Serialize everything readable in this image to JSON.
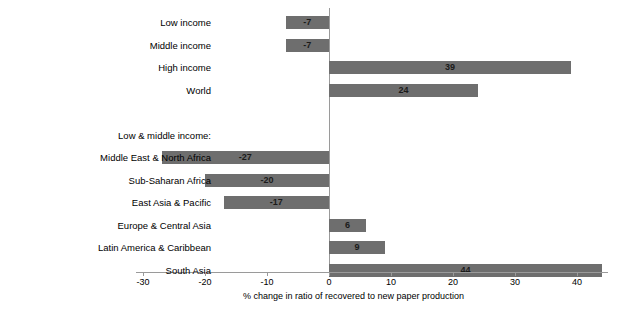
{
  "chart_data": {
    "type": "bar",
    "orientation": "horizontal",
    "title": "",
    "xlabel": "% change in ratio of recovered to new paper production",
    "ylabel": "",
    "xlim": [
      -30,
      45
    ],
    "xticks": [
      -30,
      -20,
      -10,
      0,
      10,
      20,
      30,
      40
    ],
    "xticklabels": [
      "-30",
      "-20",
      "-10",
      "0",
      "10",
      "20",
      "30",
      "40"
    ],
    "grid": false,
    "legend": false,
    "bar_color": "#6e6e6e",
    "categories": [
      "Low income",
      "Middle income",
      "High income",
      "World",
      "Middle East & North Africa",
      "Sub-Saharan Africa",
      "East Asia & Pacific",
      "Europe & Central Asia",
      "Latin America & Caribbean",
      "South Asia"
    ],
    "values": [
      -7,
      -7,
      39,
      24,
      -27,
      -20,
      -17,
      6,
      9,
      44
    ],
    "group_header": "Low & middle income:",
    "group_header_after_index": 3
  },
  "rows": [
    {
      "label": "Low income",
      "value": -7,
      "value_text": "-7",
      "type": "bar"
    },
    {
      "label": "Middle income",
      "value": -7,
      "value_text": "-7",
      "type": "bar"
    },
    {
      "label": "High income",
      "value": 39,
      "value_text": "39",
      "type": "bar"
    },
    {
      "label": "World",
      "value": 24,
      "value_text": "24",
      "type": "bar"
    },
    {
      "label": "",
      "value": null,
      "value_text": "",
      "type": "spacer"
    },
    {
      "label": "Low & middle income:",
      "value": null,
      "value_text": "",
      "type": "header"
    },
    {
      "label": "Middle East & North Africa",
      "value": -27,
      "value_text": "-27",
      "type": "bar"
    },
    {
      "label": "Sub-Saharan Africa",
      "value": -20,
      "value_text": "-20",
      "type": "bar"
    },
    {
      "label": "East Asia & Pacific",
      "value": -17,
      "value_text": "-17",
      "type": "bar"
    },
    {
      "label": "Europe & Central Asia",
      "value": 6,
      "value_text": "6",
      "type": "bar"
    },
    {
      "label": "Latin America & Caribbean",
      "value": 9,
      "value_text": "9",
      "type": "bar"
    },
    {
      "label": "South Asia",
      "value": 44,
      "value_text": "44",
      "type": "bar"
    }
  ],
  "axis": {
    "title": "% change in ratio of recovered to new paper production",
    "ticks": [
      "-30",
      "-20",
      "-10",
      "0",
      "10",
      "20",
      "30",
      "40"
    ]
  }
}
